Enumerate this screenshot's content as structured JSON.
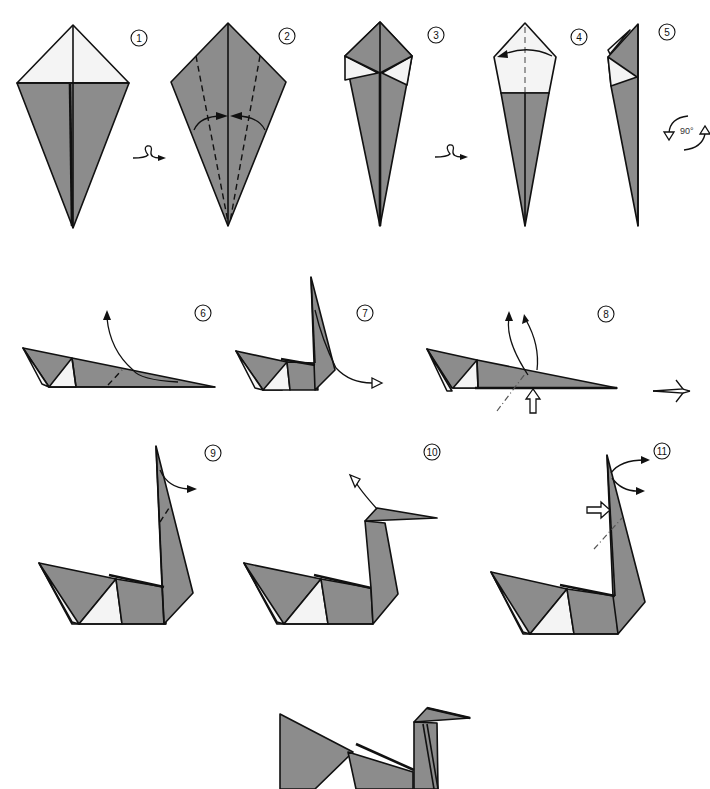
{
  "caption": {
    "text": "",
    "note": "top caption line is clipped at the image edge; only descenders visible"
  },
  "colors": {
    "paper_colored_side": "#8c8c8c",
    "paper_white_side": "#f4f4f4",
    "line": "#111111",
    "background": "#ffffff"
  },
  "steps": [
    {
      "number": "1",
      "label": "1"
    },
    {
      "number": "2",
      "label": "2"
    },
    {
      "number": "3",
      "label": "3"
    },
    {
      "number": "4",
      "label": "4"
    },
    {
      "number": "5",
      "label": "5"
    },
    {
      "number": "6",
      "label": "6"
    },
    {
      "number": "7",
      "label": "7"
    },
    {
      "number": "8",
      "label": "8"
    },
    {
      "number": "9",
      "label": "9"
    },
    {
      "number": "10",
      "label": "10"
    },
    {
      "number": "11",
      "label": "11"
    }
  ],
  "symbols": {
    "turn_over": "turn-over-icon",
    "rotate": {
      "label": "90°",
      "icon": "rotate-90-icon"
    },
    "next": "next-view-arrow-icon"
  }
}
